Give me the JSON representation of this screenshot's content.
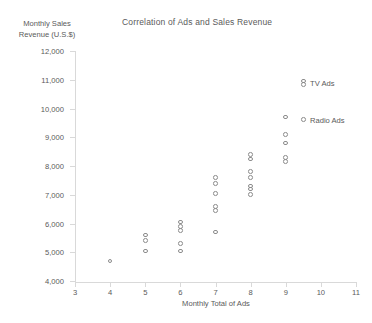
{
  "chart_data": {
    "type": "scatter",
    "title": "Correlation of Ads and Sales Revenue",
    "xlabel": "Monthly Total of Ads",
    "ylabel": "Monthly Sales Revenue (U.S.$)",
    "ylabel_line1": "Monthly Sales",
    "ylabel_line2": "Revenue (U.S.$)",
    "xlim": [
      3,
      11
    ],
    "ylim": [
      4000,
      12000
    ],
    "xticks": [
      3,
      4,
      5,
      6,
      7,
      8,
      9,
      10,
      11
    ],
    "xtick_labels": [
      "3",
      "4",
      "5",
      "6",
      "7",
      "8",
      "9",
      "10",
      "11"
    ],
    "yticks": [
      4000,
      5000,
      6000,
      7000,
      8000,
      9000,
      10000,
      11000,
      12000
    ],
    "ytick_labels": [
      "4,000",
      "5,000",
      "6,000",
      "7,000",
      "8,000",
      "9,000",
      "10,000",
      "11,000",
      "12,000"
    ],
    "grid": false,
    "legend_position": "right",
    "marker_color": "#8c8c8c",
    "marker_style": "open-circle",
    "legend": [
      {
        "name": "TV Ads",
        "marker": "open-circle"
      },
      {
        "name": "Radio Ads",
        "marker": "open-circle"
      }
    ],
    "points": [
      {
        "x": 4,
        "y": 4700
      },
      {
        "x": 5,
        "y": 5600
      },
      {
        "x": 5,
        "y": 5400
      },
      {
        "x": 5,
        "y": 5050
      },
      {
        "x": 6,
        "y": 6050
      },
      {
        "x": 6,
        "y": 5900
      },
      {
        "x": 6,
        "y": 5750
      },
      {
        "x": 6,
        "y": 5300
      },
      {
        "x": 6,
        "y": 5050
      },
      {
        "x": 7,
        "y": 7600
      },
      {
        "x": 7,
        "y": 7400
      },
      {
        "x": 7,
        "y": 7050
      },
      {
        "x": 7,
        "y": 6600
      },
      {
        "x": 7,
        "y": 6450
      },
      {
        "x": 7,
        "y": 5700
      },
      {
        "x": 8,
        "y": 8400
      },
      {
        "x": 8,
        "y": 8250
      },
      {
        "x": 8,
        "y": 7800
      },
      {
        "x": 8,
        "y": 7600
      },
      {
        "x": 8,
        "y": 7300
      },
      {
        "x": 8,
        "y": 7200
      },
      {
        "x": 8,
        "y": 7000
      },
      {
        "x": 9,
        "y": 9700
      },
      {
        "x": 9,
        "y": 9100
      },
      {
        "x": 9,
        "y": 8800
      },
      {
        "x": 9,
        "y": 8300
      },
      {
        "x": 9,
        "y": 8150
      }
    ]
  }
}
